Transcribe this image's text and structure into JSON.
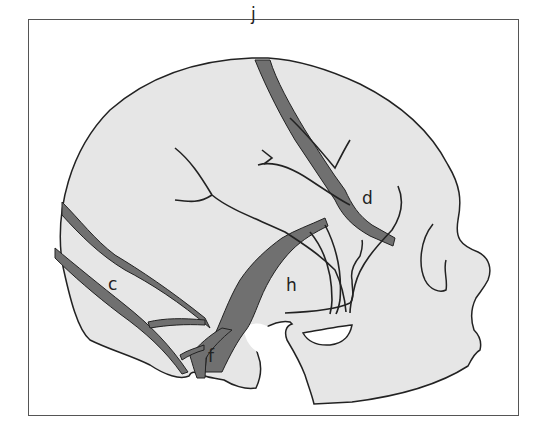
{
  "diagram": {
    "type": "anatomical-illustration",
    "colors": {
      "background": "#ffffff",
      "frame": "#555555",
      "skull_fill": "#e6e6e6",
      "outline": "#222222",
      "vessel_fill": "#707070",
      "vessel_highlight": "#c8c8c8"
    },
    "labels": [
      {
        "id": "j",
        "text": "j",
        "x": 251,
        "y": 6
      },
      {
        "id": "d",
        "text": "d",
        "x": 362,
        "y": 190
      },
      {
        "id": "c",
        "text": "c",
        "x": 108,
        "y": 276
      },
      {
        "id": "h",
        "text": "h",
        "x": 286,
        "y": 277
      },
      {
        "id": "f",
        "text": "f",
        "x": 208,
        "y": 348
      }
    ]
  }
}
